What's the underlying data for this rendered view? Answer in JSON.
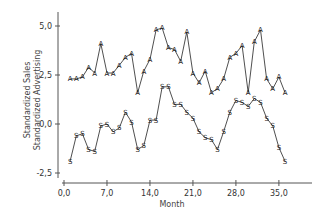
{
  "chart_data": {
    "type": "line",
    "title": "",
    "xlabel": "Month",
    "ylabel": [
      "Standardized Sales",
      "Standardized Advertising"
    ],
    "xlim": [
      0,
      41
    ],
    "ylim": [
      -2.5,
      5.5
    ],
    "x_ticks": [
      0,
      7,
      14,
      21,
      28,
      35
    ],
    "x_tick_labels": [
      "0,0",
      "7,0",
      "14,0",
      "21,0",
      "28,0",
      "35,0"
    ],
    "y_ticks": [
      5.0,
      2.5,
      0.0,
      -2.5
    ],
    "y_tick_labels": [
      "5,0",
      "2,5",
      "0,0",
      "-2,5"
    ],
    "grid": false,
    "legend": "none (series identified by plot markers A and S)",
    "x": [
      1,
      2,
      3,
      4,
      5,
      6,
      7,
      8,
      9,
      10,
      11,
      12,
      13,
      14,
      15,
      16,
      17,
      18,
      19,
      20,
      21,
      22,
      23,
      24,
      25,
      26,
      27,
      28,
      29,
      30,
      31,
      32,
      33,
      34,
      35,
      36
    ],
    "series": [
      {
        "name": "Standardized Advertising",
        "marker": "A",
        "values": [
          2.3,
          2.3,
          2.4,
          2.9,
          2.6,
          4.1,
          2.6,
          2.6,
          3.0,
          3.4,
          3.6,
          1.6,
          2.7,
          3.3,
          4.8,
          4.9,
          3.9,
          3.8,
          3.2,
          4.7,
          2.6,
          2.1,
          2.7,
          1.6,
          1.8,
          2.3,
          3.4,
          3.6,
          4.0,
          1.6,
          4.2,
          4.8,
          2.3,
          1.8,
          2.4,
          1.6
        ]
      },
      {
        "name": "Standardized Sales",
        "marker": "S",
        "values": [
          -1.9,
          -0.6,
          -0.5,
          -1.3,
          -1.4,
          -0.1,
          0.0,
          -0.4,
          -0.2,
          0.6,
          0.1,
          -1.3,
          -1.1,
          0.2,
          0.2,
          1.9,
          1.9,
          1.0,
          1.0,
          0.6,
          0.3,
          -0.4,
          -0.7,
          -0.8,
          -1.3,
          -0.4,
          0.6,
          1.2,
          1.1,
          0.9,
          1.3,
          1.1,
          0.3,
          -0.1,
          -1.2,
          -1.9
        ]
      }
    ]
  },
  "labels": {
    "xlabel": "Month",
    "ylabel_line1": "Standardized Sales",
    "ylabel_line2": "Standardized Advertising"
  }
}
